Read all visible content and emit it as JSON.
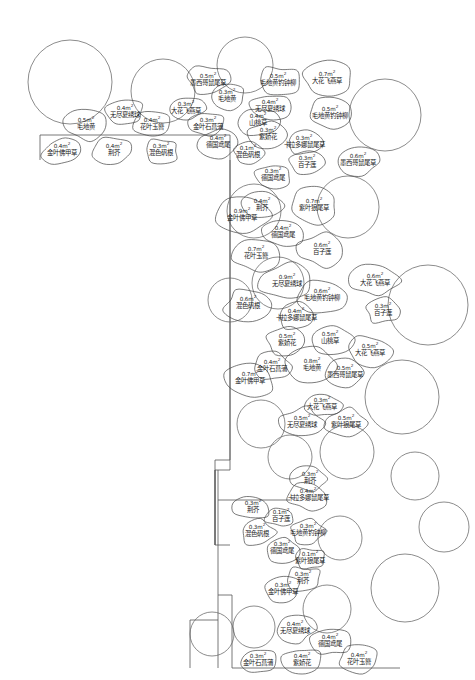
{
  "document": {
    "kind": "landscape-planting-plan",
    "area_unit": "m",
    "area_unit_exponent": "2",
    "line_color": "#555555",
    "text_color": "#1a1a1a",
    "background": "#ffffff"
  },
  "plants": [
    {
      "id": "p01",
      "area": "0.5m",
      "name": "墨西哥鼠尾草",
      "x": 208,
      "y": 80
    },
    {
      "id": "p02",
      "area": "0.5m",
      "name": "毛地黄钓钟柳",
      "x": 278,
      "y": 80
    },
    {
      "id": "p03",
      "area": "0.7m",
      "name": "大花飞燕草",
      "x": 327,
      "y": 78
    },
    {
      "id": "p04",
      "area": "0.3m",
      "name": "毛地黄",
      "x": 227,
      "y": 96
    },
    {
      "id": "p05",
      "area": "0.4m",
      "name": "无尽夏绣球",
      "x": 125,
      "y": 112
    },
    {
      "id": "p06",
      "area": "0.3m",
      "name": "大花飞燕草",
      "x": 186,
      "y": 108
    },
    {
      "id": "p07",
      "area": "0.4m",
      "name": "无尽夏绣球",
      "x": 270,
      "y": 106
    },
    {
      "id": "p08",
      "area": "0.5m",
      "name": "毛地黄钓钟柳",
      "x": 330,
      "y": 113
    },
    {
      "id": "p09",
      "area": "0.5m",
      "name": "毛地黄",
      "x": 86,
      "y": 124
    },
    {
      "id": "p10",
      "area": "0.4m",
      "name": "花叶玉簪",
      "x": 152,
      "y": 124
    },
    {
      "id": "p11",
      "area": "0.3m",
      "name": "金叶石菖蒲",
      "x": 208,
      "y": 124
    },
    {
      "id": "p12",
      "area": "0.4m",
      "name": "山桃草",
      "x": 258,
      "y": 120
    },
    {
      "id": "p13",
      "area": "0.3m",
      "name": "紫娇花",
      "x": 268,
      "y": 134
    },
    {
      "id": "p14",
      "area": "0.4m",
      "name": "德国鸢尾",
      "x": 218,
      "y": 142
    },
    {
      "id": "p15",
      "area": "0.4m",
      "name": "金叶佛甲草",
      "x": 62,
      "y": 150
    },
    {
      "id": "p16",
      "area": "0.4m",
      "name": "荆芥",
      "x": 114,
      "y": 150
    },
    {
      "id": "p17",
      "area": "0.3m",
      "name": "混色矾根",
      "x": 161,
      "y": 150
    },
    {
      "id": "p18",
      "area": "0.1m",
      "name": "混色矾根",
      "x": 248,
      "y": 152
    },
    {
      "id": "p19",
      "area": "0.3m",
      "name": "卡拉多娜鼠尾草",
      "x": 304,
      "y": 142
    },
    {
      "id": "p20",
      "area": "0.3m",
      "name": "百子莲",
      "x": 307,
      "y": 162
    },
    {
      "id": "p21",
      "area": "0.6m",
      "name": "墨西哥鼠尾草",
      "x": 358,
      "y": 160
    },
    {
      "id": "p22",
      "area": "0.3m",
      "name": "德国鸢尾",
      "x": 273,
      "y": 175
    },
    {
      "id": "p23",
      "area": "0.7m",
      "name": "紫叶狼尾草",
      "x": 314,
      "y": 205
    },
    {
      "id": "p24",
      "area": "0.4m",
      "name": "荆芥",
      "x": 262,
      "y": 205
    },
    {
      "id": "p25",
      "area": "0.9m",
      "name": "金叶佛甲草",
      "x": 242,
      "y": 215
    },
    {
      "id": "p26",
      "area": "0.4m",
      "name": "德国鸢尾",
      "x": 283,
      "y": 232
    },
    {
      "id": "p27",
      "area": "0.7m",
      "name": "花叶玉簪",
      "x": 256,
      "y": 253
    },
    {
      "id": "p28",
      "area": "0.6m",
      "name": "百子莲",
      "x": 322,
      "y": 249
    },
    {
      "id": "p29",
      "area": "0.9m",
      "name": "无尽夏绣球",
      "x": 287,
      "y": 281
    },
    {
      "id": "p30",
      "area": "0.6m",
      "name": "大花飞燕草",
      "x": 375,
      "y": 280
    },
    {
      "id": "p31",
      "area": "0.6m",
      "name": "毛地黄钓钟柳",
      "x": 322,
      "y": 295
    },
    {
      "id": "p32",
      "area": "0.6m",
      "name": "混色矾根",
      "x": 248,
      "y": 303
    },
    {
      "id": "p33",
      "area": "0.3m",
      "name": "百子莲",
      "x": 383,
      "y": 310
    },
    {
      "id": "p34",
      "area": "0.4m",
      "name": "卡拉多娜鼠尾草",
      "x": 296,
      "y": 315
    },
    {
      "id": "p35",
      "area": "0.5m",
      "name": "紫娇花",
      "x": 287,
      "y": 340
    },
    {
      "id": "p36",
      "area": "0.5m",
      "name": "山桃草",
      "x": 330,
      "y": 338
    },
    {
      "id": "p37",
      "area": "0.5m",
      "name": "大花飞燕草",
      "x": 370,
      "y": 350
    },
    {
      "id": "p38",
      "area": "0.4m",
      "name": "金叶石菖蒲",
      "x": 272,
      "y": 366
    },
    {
      "id": "p39",
      "area": "0.8m",
      "name": "毛地黄",
      "x": 312,
      "y": 365
    },
    {
      "id": "p40",
      "area": "0.5m",
      "name": "墨西哥鼠尾草",
      "x": 345,
      "y": 372
    },
    {
      "id": "p41",
      "area": "0.7m",
      "name": "金叶佛甲草",
      "x": 250,
      "y": 378
    },
    {
      "id": "p42",
      "area": "0.3m",
      "name": "大花飞燕草",
      "x": 322,
      "y": 404
    },
    {
      "id": "p43",
      "area": "0.5m",
      "name": "无尽夏绣球",
      "x": 302,
      "y": 422
    },
    {
      "id": "p44",
      "area": "0.5m",
      "name": "紫叶狼尾草",
      "x": 346,
      "y": 422
    },
    {
      "id": "p45",
      "area": "0.3m",
      "name": "荆芥",
      "x": 310,
      "y": 478
    },
    {
      "id": "p46",
      "area": "0.4m",
      "name": "卡拉多娜鼠尾草",
      "x": 308,
      "y": 495
    },
    {
      "id": "p47",
      "area": "0.3m",
      "name": "荆芥",
      "x": 253,
      "y": 507
    },
    {
      "id": "p48",
      "area": "0.1m",
      "name": "百子莲",
      "x": 281,
      "y": 516
    },
    {
      "id": "p49",
      "area": "0.3m",
      "name": "混色矾根",
      "x": 257,
      "y": 531
    },
    {
      "id": "p50",
      "area": "0.3m",
      "name": "毛地黄钓钟柳",
      "x": 308,
      "y": 530
    },
    {
      "id": "p51",
      "area": "0.3m",
      "name": "德国鸢尾",
      "x": 282,
      "y": 548
    },
    {
      "id": "p52",
      "area": "0.1m",
      "name": "紫叶狼尾草",
      "x": 310,
      "y": 558
    },
    {
      "id": "p53",
      "area": "0.3m",
      "name": "荆芥",
      "x": 303,
      "y": 578
    },
    {
      "id": "p54",
      "area": "0.3m",
      "name": "金叶佛甲草",
      "x": 283,
      "y": 589
    },
    {
      "id": "p55",
      "area": "0.4m",
      "name": "无尽夏绣球",
      "x": 295,
      "y": 628
    },
    {
      "id": "p56",
      "area": "0.4m",
      "name": "德国鸢尾",
      "x": 330,
      "y": 641
    },
    {
      "id": "p57",
      "area": "0.3m",
      "name": "金叶石菖蒲",
      "x": 258,
      "y": 660
    },
    {
      "id": "p58",
      "area": "0.4m",
      "name": "紫娇花",
      "x": 302,
      "y": 660
    },
    {
      "id": "p59",
      "area": "0.4m",
      "name": "花叶玉簪",
      "x": 359,
      "y": 659
    }
  ],
  "trees": [
    {
      "id": "t1",
      "cx": 70,
      "cy": 82,
      "r": 42
    },
    {
      "id": "t2",
      "cx": 163,
      "cy": 91,
      "r": 32
    },
    {
      "id": "t3",
      "cx": 245,
      "cy": 65,
      "r": 28
    },
    {
      "id": "t4",
      "cx": 385,
      "cy": 115,
      "r": 36
    },
    {
      "id": "t5",
      "cx": 254,
      "cy": 211,
      "r": 27
    },
    {
      "id": "t6",
      "cx": 348,
      "cy": 207,
      "r": 31
    },
    {
      "id": "t7",
      "cx": 428,
      "cy": 305,
      "r": 40
    },
    {
      "id": "t8",
      "cx": 278,
      "cy": 283,
      "r": 26
    },
    {
      "id": "t9",
      "cx": 230,
      "cy": 300,
      "r": 22
    },
    {
      "id": "t10",
      "cx": 402,
      "cy": 397,
      "r": 37
    },
    {
      "id": "t11",
      "cx": 347,
      "cy": 452,
      "r": 27
    },
    {
      "id": "t12",
      "cx": 261,
      "cy": 424,
      "r": 24
    },
    {
      "id": "t13",
      "cx": 415,
      "cy": 476,
      "r": 24
    },
    {
      "id": "t14",
      "cx": 405,
      "cy": 588,
      "r": 34
    },
    {
      "id": "t15",
      "cx": 444,
      "cy": 527,
      "r": 25
    },
    {
      "id": "t16",
      "cx": 327,
      "cy": 609,
      "r": 24
    },
    {
      "id": "t17",
      "cx": 254,
      "cy": 627,
      "r": 21
    },
    {
      "id": "t18",
      "cx": 212,
      "cy": 634,
      "r": 22
    },
    {
      "id": "t19",
      "cx": 290,
      "cy": 457,
      "r": 22
    },
    {
      "id": "t20",
      "cx": 340,
      "cy": 538,
      "r": 22
    }
  ]
}
